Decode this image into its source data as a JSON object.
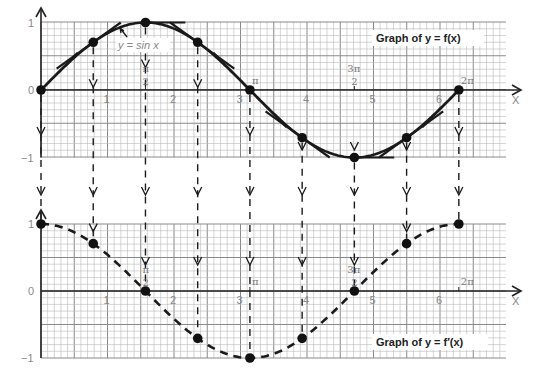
{
  "chart_data": [
    {
      "type": "line",
      "title": "Graph of y = f(x)",
      "curve_label": "y = sin x",
      "xlabel": "X",
      "ylabel": "",
      "xlim": [
        0,
        7
      ],
      "ylim": [
        -1,
        1
      ],
      "grid": true,
      "legend": "top-right",
      "x_ticks": [
        "1",
        "2",
        "3",
        "4",
        "5",
        "6"
      ],
      "x_tick_values": [
        1,
        2,
        3,
        4,
        5,
        6
      ],
      "y_ticks": [
        "1",
        "0",
        "−1"
      ],
      "y_tick_values": [
        1,
        0,
        -1
      ],
      "pi_ticks": [
        {
          "num": "π",
          "den": "2",
          "value": 1.5708
        },
        {
          "num": "π",
          "den": "",
          "value": 3.1416
        },
        {
          "num": "3π",
          "den": "2",
          "value": 4.7124
        },
        {
          "num": "2π",
          "den": "",
          "value": 6.2832
        }
      ],
      "series": [
        {
          "name": "f(x) = sin x",
          "x": [
            0,
            0.7854,
            1.5708,
            2.3562,
            3.1416,
            3.927,
            4.7124,
            5.4978,
            6.2832
          ],
          "y": [
            0,
            0.707,
            1,
            0.707,
            0,
            -0.707,
            -1,
            -0.707,
            0
          ]
        }
      ],
      "tangent_lines_at_points": true
    },
    {
      "type": "line",
      "title": "Graph of y = f′(x)",
      "xlabel": "X",
      "ylabel": "",
      "xlim": [
        0,
        7
      ],
      "ylim": [
        -1,
        1
      ],
      "grid": true,
      "legend": "bottom-right",
      "x_ticks": [
        "1",
        "2",
        "3",
        "4",
        "5",
        "6"
      ],
      "x_tick_values": [
        1,
        2,
        3,
        4,
        5,
        6
      ],
      "y_ticks": [
        "1",
        "0",
        "−1"
      ],
      "y_tick_values": [
        1,
        0,
        -1
      ],
      "pi_ticks": [
        {
          "num": "π",
          "den": "2",
          "value": 1.5708
        },
        {
          "num": "π",
          "den": "",
          "value": 3.1416
        },
        {
          "num": "3π",
          "den": "2",
          "value": 4.7124
        },
        {
          "num": "2π",
          "den": "",
          "value": 6.2832
        }
      ],
      "series": [
        {
          "name": "f′(x) = cos x",
          "style": "dashed",
          "x": [
            0,
            0.7854,
            1.5708,
            2.3562,
            3.1416,
            3.927,
            4.7124,
            5.4978,
            6.2832
          ],
          "y": [
            1,
            0.707,
            0,
            -0.707,
            -1,
            -0.707,
            0,
            0.707,
            1
          ]
        }
      ]
    }
  ]
}
